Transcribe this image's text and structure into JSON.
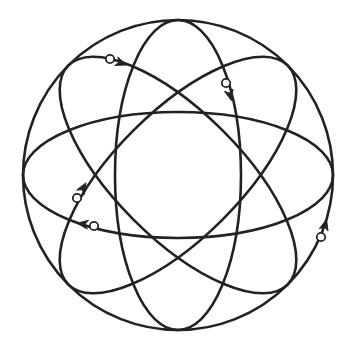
{
  "diagram": {
    "title": "",
    "type": "atomic-model",
    "background": "#ffffff",
    "stroke_color": "#222222",
    "stroke_width": 2.6,
    "nucleus_center": [
      178,
      175
    ],
    "outer_orbit": {
      "cx": 178,
      "cy": 175,
      "r": 155
    },
    "orbits": [
      {
        "name": "horizontal-orbit",
        "rx": 155,
        "ry": 63,
        "rotation": 0
      },
      {
        "name": "vertical-orbit",
        "rx": 155,
        "ry": 63,
        "rotation": 90
      },
      {
        "name": "diagonal-orbit-rising",
        "rx": 155,
        "ry": 63,
        "rotation": -45
      },
      {
        "name": "diagonal-orbit-falling",
        "rx": 155,
        "ry": 63,
        "rotation": 45
      }
    ],
    "electrons": [
      {
        "name": "electron-1",
        "orbit": "diagonal-orbit-falling",
        "x": 110,
        "y": 59,
        "arrow_x": 121,
        "arrow_y": 63,
        "arrow_angle": 20
      },
      {
        "name": "electron-2",
        "orbit": "vertical-orbit",
        "x": 226,
        "y": 83,
        "arrow_x": 230,
        "arrow_y": 95,
        "arrow_angle": 75
      },
      {
        "name": "electron-3",
        "orbit": "diagonal-orbit-rising",
        "x": 77,
        "y": 198,
        "arrow_x": 83,
        "arrow_y": 188,
        "arrow_angle": -60
      },
      {
        "name": "electron-4",
        "orbit": "horizontal-orbit",
        "x": 94,
        "y": 226,
        "arrow_x": 83,
        "arrow_y": 224,
        "arrow_angle": 188
      },
      {
        "name": "electron-5",
        "orbit": "outer-orbit",
        "x": 321,
        "y": 237,
        "arrow_x": 325,
        "arrow_y": 225,
        "arrow_angle": -75
      }
    ],
    "electron_radius": 4.2
  }
}
